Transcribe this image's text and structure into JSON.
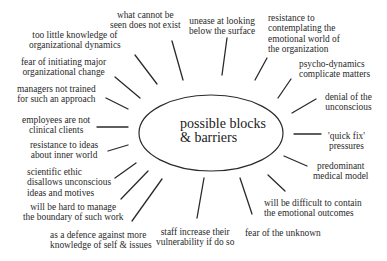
{
  "diagram": {
    "center": {
      "line1": "possible blocks",
      "line2": "& barriers"
    },
    "labels": [
      {
        "id": "what-cannot-be-seen",
        "l1": "what cannot be",
        "l2": "seen does not exist"
      },
      {
        "id": "unease-below-surface",
        "l1": "unease at looking",
        "l2": "below the surface"
      },
      {
        "id": "resistance-emotional-world",
        "l1": "resistance to",
        "l2": "contemplating the",
        "l3": "emotional world of",
        "l4": "the organization"
      },
      {
        "id": "too-little-knowledge",
        "l1": "too little knowledge of",
        "l2": "organizational dynamics"
      },
      {
        "id": "psycho-dynamics",
        "l1": "psycho-dynamics",
        "l2": "complicate matters"
      },
      {
        "id": "fear-initiating-change",
        "l1": "fear of initiating major",
        "l2": "organizational change"
      },
      {
        "id": "managers-not-trained",
        "l1": "managers not trained",
        "l2": "for such an approach"
      },
      {
        "id": "denial-unconscious",
        "l1": "denial of the",
        "l2": "unconscious"
      },
      {
        "id": "employees-not-clients",
        "l1": "employees are not",
        "l2": "clinical clients"
      },
      {
        "id": "quick-fix",
        "l1": "'quick fix'",
        "l2": "pressures"
      },
      {
        "id": "resistance-inner-world",
        "l1": "resistance to ideas",
        "l2": "about inner world"
      },
      {
        "id": "medical-model",
        "l1": "predominant",
        "l2": "medical model"
      },
      {
        "id": "scientific-ethic",
        "l1": "scientific ethic",
        "l2": "disallows unconscious",
        "l3": "ideas and motives"
      },
      {
        "id": "emotional-outcomes",
        "l1": "will be difficult to contain",
        "l2": "the emotional outcomes"
      },
      {
        "id": "manage-boundary",
        "l1": "will be hard to manage",
        "l2": "the boundary of such work"
      },
      {
        "id": "defence-knowledge",
        "l1": "as a defence against more",
        "l2": "knowledge of self & issues"
      },
      {
        "id": "staff-vulnerability",
        "l1": "staff increase their",
        "l2": "vulnerability if do so"
      },
      {
        "id": "fear-unknown",
        "l1": "fear of the unknown"
      }
    ],
    "colors": {
      "ink": "#222222",
      "background": "#ffffff"
    }
  }
}
